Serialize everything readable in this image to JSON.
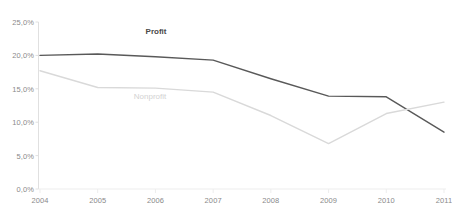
{
  "chart_data": {
    "type": "line",
    "title": "",
    "xlabel": "",
    "ylabel": "",
    "x": [
      "2004",
      "2005",
      "2006",
      "2007",
      "2008",
      "2009",
      "2010",
      "2011"
    ],
    "categories": [
      "2004",
      "2005",
      "2006",
      "2007",
      "2008",
      "2009",
      "2010",
      "2011"
    ],
    "ylim": [
      0,
      25
    ],
    "ytick_values": [
      25,
      20,
      15,
      10,
      5,
      0
    ],
    "ytick_labels": [
      "25,0%",
      "20,0%",
      "15,0%",
      "10,0%",
      "5,0%",
      "0,0%"
    ],
    "grid": false,
    "legend_position": "inline-annotations",
    "series": [
      {
        "name": "Profit",
        "color": "#595959",
        "label_bold": true,
        "values": [
          20.0,
          20.2,
          19.8,
          19.3,
          16.5,
          13.9,
          13.8,
          8.5
        ]
      },
      {
        "name": "Nonprofit",
        "color": "#d9d9d9",
        "label_bold": false,
        "values": [
          17.7,
          15.2,
          15.1,
          14.5,
          11.0,
          6.8,
          11.3,
          13.0
        ]
      }
    ],
    "annotations": [
      {
        "text": "Profit",
        "x_px": 156,
        "y_px": 31,
        "series": "Profit"
      },
      {
        "text": "Nonprofit",
        "x_px": 150,
        "y_px": 96,
        "series": "Nonprofit"
      }
    ]
  },
  "axis": {
    "y_axis_color": "#e0e0e0",
    "x_axis_color": "#ededed",
    "tick_color": "#e0e0e0",
    "label_color": "#8a8a8a"
  }
}
